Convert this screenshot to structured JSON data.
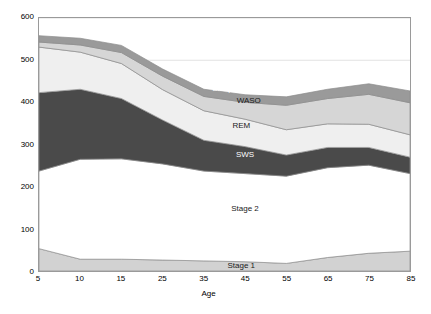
{
  "chart_data": {
    "type": "area",
    "stacked": true,
    "title": "",
    "xlabel": "Age",
    "ylabel": "",
    "x": [
      5,
      10,
      15,
      25,
      35,
      45,
      55,
      65,
      75,
      85
    ],
    "xtick_labels": [
      "5",
      "10",
      "15",
      "25",
      "35",
      "45",
      "55",
      "65",
      "75",
      "85"
    ],
    "ytick_labels": [
      "0",
      "100",
      "200",
      "300",
      "400",
      "500",
      "600"
    ],
    "yticks": [
      0,
      100,
      200,
      300,
      400,
      500,
      600
    ],
    "ylim": [
      0,
      600
    ],
    "grid": true,
    "legend_position": "inline-labels",
    "series": [
      {
        "name": "Stage 1",
        "color": "#d2d2d2",
        "values": [
          53,
          28,
          28,
          26,
          24,
          22,
          18,
          32,
          42,
          47
        ]
      },
      {
        "name": "Stage 2",
        "color": "#ffffff",
        "values": [
          184,
          237,
          238,
          228,
          213,
          209,
          207,
          213,
          209,
          184
        ]
      },
      {
        "name": "SWS",
        "color": "#4a4a4a",
        "values": [
          186,
          166,
          143,
          104,
          73,
          64,
          50,
          48,
          42,
          39
        ]
      },
      {
        "name": "REM",
        "color": "#efefef",
        "values": [
          108,
          88,
          83,
          72,
          70,
          65,
          60,
          56,
          55,
          53
        ]
      },
      {
        "name": "WASO",
        "color": "#d6d6d6",
        "values": [
          12,
          17,
          26,
          32,
          34,
          40,
          58,
          60,
          71,
          76
        ]
      },
      {
        "name": "Sleep Latency",
        "color": "#9a9a9a",
        "values": [
          15,
          16,
          17,
          17,
          17,
          18,
          20,
          22,
          25,
          28
        ]
      }
    ],
    "annotations": [
      {
        "label": "Sleep Latency",
        "x_px_frac": 0.535,
        "y_value": 433,
        "style": "dark"
      },
      {
        "label": "WASO",
        "x_px_frac": 0.565,
        "y_value": 404,
        "style": "light"
      },
      {
        "label": "REM",
        "x_px_frac": 0.545,
        "y_value": 346,
        "style": "light"
      },
      {
        "label": "SWS",
        "x_px_frac": 0.555,
        "y_value": 278,
        "style": "dark"
      },
      {
        "label": "Stage 2",
        "x_px_frac": 0.555,
        "y_value": 151,
        "style": "light"
      },
      {
        "label": "Stage 1",
        "x_px_frac": 0.545,
        "y_value": 17,
        "style": "light"
      }
    ]
  },
  "axis": {
    "x_title": "Age"
  }
}
